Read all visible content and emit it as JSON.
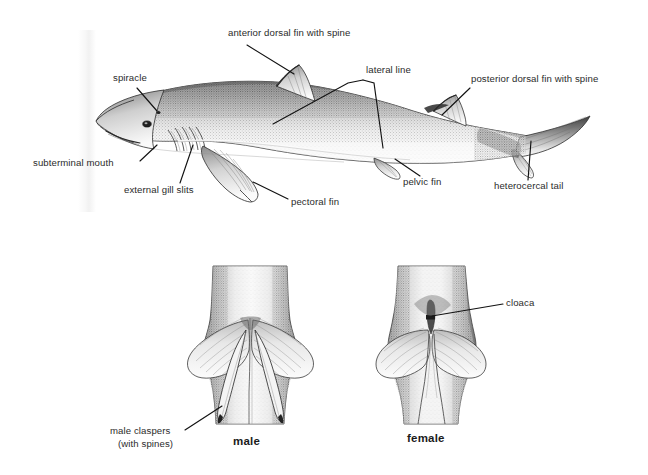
{
  "figure": {
    "background_color": "#ffffff",
    "ink_color": "#1b1b1b",
    "label_color": "#2b2b2b",
    "panels": [
      {
        "id": "lateral-view",
        "caption": ""
      },
      {
        "id": "male-ventral",
        "caption": "male"
      },
      {
        "id": "female-ventral",
        "caption": "female"
      }
    ]
  },
  "lateral_view": {
    "labels": [
      {
        "key": "anterior_dorsal_fin",
        "text": "anterior dorsal fin with spine"
      },
      {
        "key": "spiracle",
        "text": "spiracle"
      },
      {
        "key": "lateral_line",
        "text": "lateral line"
      },
      {
        "key": "posterior_dorsal_fin",
        "text": "posterior dorsal fin with spine"
      },
      {
        "key": "subterminal_mouth",
        "text": "subterminal mouth"
      },
      {
        "key": "external_gill_slits",
        "text": "external gill slits"
      },
      {
        "key": "pectoral_fin",
        "text": "pectoral fin"
      },
      {
        "key": "pelvic_fin",
        "text": "pelvic fin"
      },
      {
        "key": "heterocercal_tail",
        "text": "heterocercal tail"
      }
    ]
  },
  "ventral_views": {
    "male": {
      "caption": "male",
      "label_line_1": "male claspers",
      "label_line_2": "(with spines)"
    },
    "female": {
      "caption": "female",
      "label_cloaca": "cloaca"
    }
  }
}
